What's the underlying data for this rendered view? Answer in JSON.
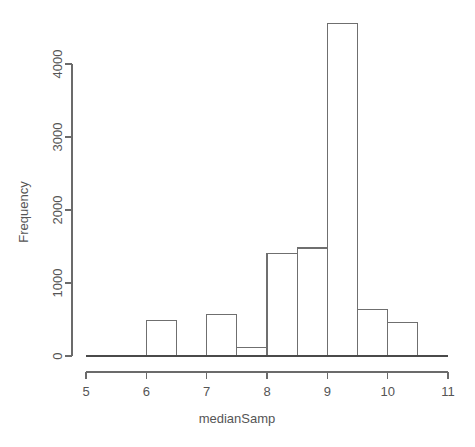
{
  "chart_data": {
    "type": "bar",
    "title": "",
    "subtitle": "",
    "xlabel": "medianSamp",
    "ylabel": "Frequency",
    "grid": false,
    "legend": null,
    "legend_position": "none",
    "bin_width": 0.5,
    "xlim": [
      5,
      11
    ],
    "ylim": [
      0,
      4550
    ],
    "x_ticks": [
      5,
      6,
      7,
      8,
      9,
      10,
      11
    ],
    "x_tick_labels": [
      "5",
      "6",
      "7",
      "8",
      "9",
      "10",
      "11"
    ],
    "y_ticks": [
      0,
      1000,
      2000,
      3000,
      4000
    ],
    "y_tick_labels": [
      "0",
      "1000",
      "2000",
      "3000",
      "4000"
    ],
    "bins": [
      {
        "start": 5.0,
        "end": 5.5,
        "value": 0
      },
      {
        "start": 5.5,
        "end": 6.0,
        "value": 0
      },
      {
        "start": 6.0,
        "end": 6.5,
        "value": 490
      },
      {
        "start": 6.5,
        "end": 7.0,
        "value": 0
      },
      {
        "start": 7.0,
        "end": 7.5,
        "value": 570
      },
      {
        "start": 7.5,
        "end": 8.0,
        "value": 120
      },
      {
        "start": 8.0,
        "end": 8.5,
        "value": 1400
      },
      {
        "start": 8.5,
        "end": 9.0,
        "value": 1480
      },
      {
        "start": 9.0,
        "end": 9.5,
        "value": 4550
      },
      {
        "start": 9.5,
        "end": 10.0,
        "value": 640
      },
      {
        "start": 10.0,
        "end": 10.5,
        "value": 460
      },
      {
        "start": 10.5,
        "end": 11.0,
        "value": 0
      }
    ],
    "categories": [
      "5-5.5",
      "5.5-6",
      "6-6.5",
      "6.5-7",
      "7-7.5",
      "7.5-8",
      "8-8.5",
      "8.5-9",
      "9-9.5",
      "9.5-10",
      "10-10.5",
      "10.5-11"
    ],
    "values": [
      0,
      0,
      490,
      0,
      570,
      120,
      1400,
      1480,
      4550,
      640,
      460,
      0
    ],
    "colors": {
      "bar_fill": "#ffffff",
      "bar_stroke": "#6f6f6f",
      "axis": "#6b6b6b",
      "text": "#555555",
      "background": "#ffffff"
    }
  }
}
